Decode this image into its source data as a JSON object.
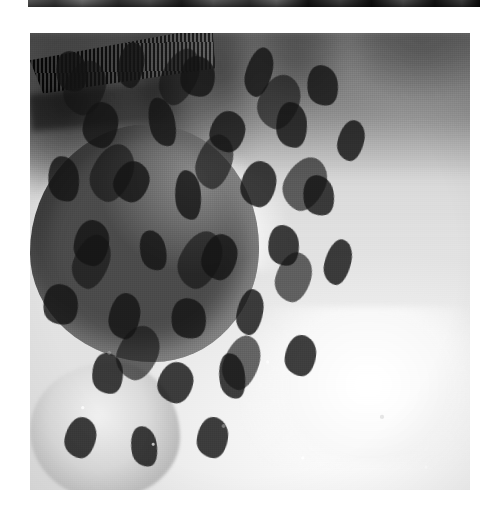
{
  "page": {
    "background_color": "#ffffff",
    "width": 489,
    "height": 512
  },
  "top_fragment": {
    "description": "dark grayscale sliver, bottom edge of preceding photograph",
    "left": 28,
    "top": 0,
    "width": 452,
    "height": 7,
    "tone": "#2b2b2b"
  },
  "photograph": {
    "caption": "",
    "subject": "fieldfare thrush standing on snow",
    "palette": {
      "snow_white": "#fbfbfb",
      "snow_shadow": "#dedede",
      "plumage_dark": "#1d1b19",
      "plumage_mid": "#6f6b67",
      "plumage_light": "#d8d5d0",
      "background_dark": "#2d2d2d"
    },
    "geometry": {
      "left": 30,
      "top": 33,
      "width": 440,
      "height": 457
    },
    "regions": [
      {
        "name": "background-vegetation",
        "tone": "dark blurred"
      },
      {
        "name": "snow-ground",
        "tone": "bright white"
      },
      {
        "name": "bird",
        "tone": "mid to dark grey"
      }
    ],
    "breast_spots": [
      {
        "x": 6,
        "y": 4,
        "w": 7,
        "h": 9,
        "r": -12
      },
      {
        "x": 20,
        "y": 2,
        "w": 6,
        "h": 10,
        "r": 8
      },
      {
        "x": 34,
        "y": 5,
        "w": 8,
        "h": 9,
        "r": -6
      },
      {
        "x": 49,
        "y": 3,
        "w": 6,
        "h": 11,
        "r": 14
      },
      {
        "x": 63,
        "y": 7,
        "w": 7,
        "h": 9,
        "r": -10
      },
      {
        "x": 12,
        "y": 15,
        "w": 8,
        "h": 10,
        "r": 6
      },
      {
        "x": 27,
        "y": 14,
        "w": 6,
        "h": 11,
        "r": -14
      },
      {
        "x": 41,
        "y": 17,
        "w": 8,
        "h": 9,
        "r": 10
      },
      {
        "x": 56,
        "y": 15,
        "w": 7,
        "h": 10,
        "r": -4
      },
      {
        "x": 70,
        "y": 19,
        "w": 6,
        "h": 9,
        "r": 12
      },
      {
        "x": 4,
        "y": 27,
        "w": 7,
        "h": 10,
        "r": -8
      },
      {
        "x": 19,
        "y": 28,
        "w": 8,
        "h": 9,
        "r": 16
      },
      {
        "x": 33,
        "y": 30,
        "w": 6,
        "h": 11,
        "r": -6
      },
      {
        "x": 48,
        "y": 28,
        "w": 8,
        "h": 10,
        "r": 9
      },
      {
        "x": 62,
        "y": 31,
        "w": 7,
        "h": 9,
        "r": -12
      },
      {
        "x": 10,
        "y": 41,
        "w": 8,
        "h": 10,
        "r": 5
      },
      {
        "x": 25,
        "y": 43,
        "w": 6,
        "h": 9,
        "r": -15
      },
      {
        "x": 39,
        "y": 44,
        "w": 8,
        "h": 10,
        "r": 11
      },
      {
        "x": 54,
        "y": 42,
        "w": 7,
        "h": 9,
        "r": -7
      },
      {
        "x": 67,
        "y": 45,
        "w": 6,
        "h": 10,
        "r": 13
      },
      {
        "x": 3,
        "y": 55,
        "w": 8,
        "h": 9,
        "r": -10
      },
      {
        "x": 18,
        "y": 57,
        "w": 7,
        "h": 10,
        "r": 7
      },
      {
        "x": 32,
        "y": 58,
        "w": 8,
        "h": 9,
        "r": -13
      },
      {
        "x": 47,
        "y": 56,
        "w": 6,
        "h": 10,
        "r": 9
      },
      {
        "x": 14,
        "y": 70,
        "w": 7,
        "h": 9,
        "r": -5
      },
      {
        "x": 29,
        "y": 72,
        "w": 8,
        "h": 9,
        "r": 12
      },
      {
        "x": 43,
        "y": 70,
        "w": 6,
        "h": 10,
        "r": -9
      },
      {
        "x": 58,
        "y": 66,
        "w": 7,
        "h": 9,
        "r": 6
      },
      {
        "x": 8,
        "y": 84,
        "w": 7,
        "h": 9,
        "r": 10
      },
      {
        "x": 23,
        "y": 86,
        "w": 6,
        "h": 9,
        "r": -11
      },
      {
        "x": 38,
        "y": 84,
        "w": 7,
        "h": 9,
        "r": 5
      }
    ],
    "flank_spots": [
      {
        "x": 8,
        "y": 6,
        "w": 9,
        "h": 12,
        "r": 18
      },
      {
        "x": 30,
        "y": 3,
        "w": 8,
        "h": 13,
        "r": 24
      },
      {
        "x": 52,
        "y": 9,
        "w": 9,
        "h": 12,
        "r": 20
      },
      {
        "x": 14,
        "y": 24,
        "w": 9,
        "h": 13,
        "r": 22
      },
      {
        "x": 38,
        "y": 22,
        "w": 8,
        "h": 12,
        "r": 16
      },
      {
        "x": 58,
        "y": 27,
        "w": 9,
        "h": 12,
        "r": 26
      },
      {
        "x": 10,
        "y": 44,
        "w": 8,
        "h": 12,
        "r": 19
      },
      {
        "x": 34,
        "y": 43,
        "w": 9,
        "h": 13,
        "r": 23
      },
      {
        "x": 56,
        "y": 48,
        "w": 8,
        "h": 11,
        "r": 15
      },
      {
        "x": 20,
        "y": 64,
        "w": 9,
        "h": 12,
        "r": 21
      },
      {
        "x": 44,
        "y": 66,
        "w": 8,
        "h": 12,
        "r": 17
      }
    ],
    "background_twigs": [
      {
        "x": 8,
        "y": 2,
        "w": 26,
        "h": 3.5,
        "r": 62
      },
      {
        "x": 20,
        "y": 1,
        "w": 30,
        "h": 3.0,
        "r": 74
      },
      {
        "x": 33,
        "y": 3,
        "w": 22,
        "h": 3.2,
        "r": 82
      },
      {
        "x": 44,
        "y": 0,
        "w": 26,
        "h": 2.8,
        "r": 96
      },
      {
        "x": 3,
        "y": 14,
        "w": 24,
        "h": 2.6,
        "r": 28
      },
      {
        "x": 52,
        "y": 4,
        "w": 18,
        "h": 2.4,
        "r": 70
      },
      {
        "x": 60,
        "y": 2,
        "w": 16,
        "h": 2.2,
        "r": 104
      }
    ],
    "foreground_stems": [
      {
        "x": 2,
        "y": 48,
        "w": 30,
        "h": 1.6,
        "r": -28,
        "cls": "soft"
      },
      {
        "x": 5,
        "y": 41,
        "w": 24,
        "h": 1.4,
        "r": -44,
        "cls": "soft"
      },
      {
        "x": 14,
        "y": 36,
        "w": 20,
        "h": 1.3,
        "r": -60,
        "cls": "pale"
      },
      {
        "x": 30,
        "y": 30,
        "w": 18,
        "h": 1.2,
        "r": -70,
        "cls": "pale"
      },
      {
        "x": 3,
        "y": 63,
        "w": 34,
        "h": 1.8,
        "r": 14,
        "cls": ""
      },
      {
        "x": 6,
        "y": 70,
        "w": 26,
        "h": 1.5,
        "r": 34,
        "cls": ""
      },
      {
        "x": 10,
        "y": 78,
        "w": 22,
        "h": 1.6,
        "r": 58,
        "cls": ""
      },
      {
        "x": 2,
        "y": 80,
        "w": 28,
        "h": 1.4,
        "r": 26,
        "cls": "soft"
      },
      {
        "x": 26,
        "y": 85,
        "w": 24,
        "h": 1.5,
        "r": -8,
        "cls": "soft"
      },
      {
        "x": 40,
        "y": 88,
        "w": 22,
        "h": 1.4,
        "r": 12,
        "cls": "pale"
      },
      {
        "x": 54,
        "y": 82,
        "w": 20,
        "h": 1.5,
        "r": -22,
        "cls": ""
      },
      {
        "x": 62,
        "y": 90,
        "w": 24,
        "h": 1.6,
        "r": 8,
        "cls": "soft"
      },
      {
        "x": 74,
        "y": 86,
        "w": 22,
        "h": 1.4,
        "r": -14,
        "cls": ""
      },
      {
        "x": 80,
        "y": 93,
        "w": 18,
        "h": 1.3,
        "r": 16,
        "cls": "pale"
      },
      {
        "x": 33,
        "y": 94,
        "w": 26,
        "h": 1.5,
        "r": -6,
        "cls": ""
      },
      {
        "x": 16,
        "y": 92,
        "w": 20,
        "h": 1.4,
        "r": 40,
        "cls": "soft"
      },
      {
        "x": 46,
        "y": 76,
        "w": 16,
        "h": 1.2,
        "r": 30,
        "cls": "pale"
      },
      {
        "x": 68,
        "y": 72,
        "w": 18,
        "h": 1.3,
        "r": -34,
        "cls": "soft"
      }
    ],
    "debris_clumps": [
      {
        "x": 4,
        "y": 68,
        "w": 14,
        "h": 10
      },
      {
        "x": 1,
        "y": 82,
        "w": 12,
        "h": 9
      },
      {
        "x": 22,
        "y": 90,
        "w": 16,
        "h": 8
      },
      {
        "x": 48,
        "y": 92,
        "w": 12,
        "h": 7
      },
      {
        "x": 70,
        "y": 88,
        "w": 18,
        "h": 9
      },
      {
        "x": 86,
        "y": 78,
        "w": 14,
        "h": 11
      },
      {
        "x": 40,
        "y": 80,
        "w": 10,
        "h": 7
      },
      {
        "x": 60,
        "y": 62,
        "w": 13,
        "h": 9
      }
    ]
  }
}
